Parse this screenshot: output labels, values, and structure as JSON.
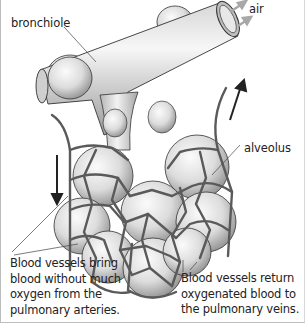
{
  "diagram": {
    "labels": {
      "bronchiole": "bronchiole",
      "air": "air",
      "alveolus": "alveolus"
    },
    "captions": {
      "left": [
        "Blood vessels bring",
        "blood without much",
        "oxygen from the",
        "pulmonary arteries."
      ],
      "right": [
        "Blood vessels return",
        "oxygenated blood to",
        "the pulmonary veins."
      ]
    },
    "arrows": {
      "left_vessel_flow": "down",
      "right_vessel_flow": "up",
      "air_flow": "in-out"
    },
    "colors": {
      "vessel": "#5a5a5a",
      "tissue": "#e6e6e6",
      "outline": "#333333",
      "border": "#bdbdbd",
      "air_arrow": "#a8a8a8"
    }
  }
}
